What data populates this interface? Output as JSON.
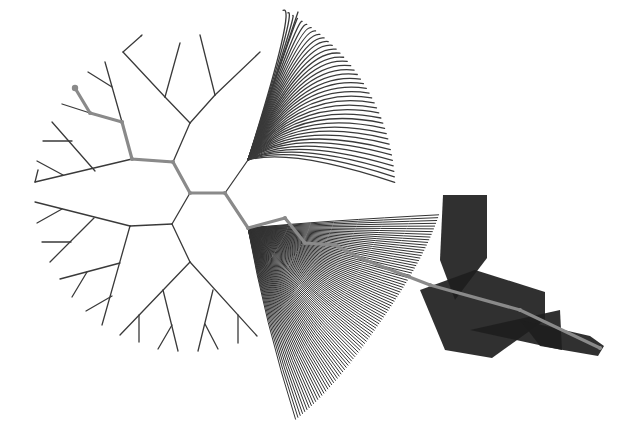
{
  "diagram": {
    "type": "radial-tree",
    "colors": {
      "background": "#ffffff",
      "edge": "#3a3a3a",
      "highlight_path": "#8a8a8a",
      "dense_fill": "#1e1e1e"
    },
    "highlight_path": [
      [
        75,
        88
      ],
      [
        90,
        113
      ],
      [
        122,
        122
      ],
      [
        132,
        159
      ],
      [
        173,
        162
      ],
      [
        190,
        193
      ],
      [
        225,
        193
      ],
      [
        248,
        228
      ],
      [
        285,
        218
      ],
      [
        305,
        243
      ],
      [
        335,
        245
      ],
      [
        360,
        258
      ],
      [
        430,
        285
      ],
      [
        520,
        310
      ],
      [
        600,
        348
      ]
    ],
    "edges": [
      [
        [
          190,
          193
        ],
        [
          225,
          193
        ]
      ],
      [
        [
          190,
          193
        ],
        [
          173,
          162
        ]
      ],
      [
        [
          190,
          193
        ],
        [
          172,
          224
        ]
      ],
      [
        [
          173,
          162
        ],
        [
          190,
          123
        ]
      ],
      [
        [
          173,
          162
        ],
        [
          132,
          159
        ]
      ],
      [
        [
          190,
          123
        ],
        [
          165,
          97
        ]
      ],
      [
        [
          165,
          97
        ],
        [
          123,
          52
        ]
      ],
      [
        [
          165,
          97
        ],
        [
          180,
          43
        ]
      ],
      [
        [
          123,
          52
        ],
        [
          141,
          36
        ]
      ],
      [
        [
          141,
          36
        ],
        [
          142,
          35
        ]
      ],
      [
        [
          190,
          123
        ],
        [
          215,
          95
        ]
      ],
      [
        [
          215,
          95
        ],
        [
          260,
          52
        ]
      ],
      [
        [
          215,
          95
        ],
        [
          200,
          35
        ]
      ],
      [
        [
          132,
          159
        ],
        [
          35,
          182
        ]
      ],
      [
        [
          132,
          159
        ],
        [
          122,
          122
        ]
      ],
      [
        [
          122,
          122
        ],
        [
          105,
          62
        ]
      ],
      [
        [
          112,
          87
        ],
        [
          88,
          72
        ]
      ],
      [
        [
          122,
          122
        ],
        [
          90,
          113
        ]
      ],
      [
        [
          90,
          113
        ],
        [
          62,
          104
        ]
      ],
      [
        [
          90,
          113
        ],
        [
          75,
          88
        ]
      ],
      [
        [
          35,
          182
        ],
        [
          38,
          170
        ]
      ],
      [
        [
          95,
          171
        ],
        [
          52,
          122
        ]
      ],
      [
        [
          72,
          141
        ],
        [
          43,
          141
        ]
      ],
      [
        [
          63,
          175
        ],
        [
          37,
          161
        ]
      ],
      [
        [
          172,
          224
        ],
        [
          130,
          226
        ]
      ],
      [
        [
          172,
          224
        ],
        [
          190,
          262
        ]
      ],
      [
        [
          130,
          226
        ],
        [
          35,
          202
        ]
      ],
      [
        [
          130,
          226
        ],
        [
          102,
          325
        ]
      ],
      [
        [
          62,
          209
        ],
        [
          37,
          223
        ]
      ],
      [
        [
          94,
          218
        ],
        [
          50,
          262
        ]
      ],
      [
        [
          71,
          242
        ],
        [
          42,
          242
        ]
      ],
      [
        [
          120,
          263
        ],
        [
          60,
          279
        ]
      ],
      [
        [
          87,
          272
        ],
        [
          72,
          297
        ]
      ],
      [
        [
          112,
          296
        ],
        [
          86,
          311
        ]
      ],
      [
        [
          190,
          262
        ],
        [
          120,
          335
        ]
      ],
      [
        [
          190,
          262
        ],
        [
          257,
          336
        ]
      ],
      [
        [
          139,
          315
        ],
        [
          139,
          342
        ]
      ],
      [
        [
          163,
          290
        ],
        [
          178,
          351
        ]
      ],
      [
        [
          172,
          325
        ],
        [
          158,
          349
        ]
      ],
      [
        [
          213,
          290
        ],
        [
          198,
          351
        ]
      ],
      [
        [
          205,
          324
        ],
        [
          218,
          349
        ]
      ],
      [
        [
          238,
          315
        ],
        [
          238,
          343
        ]
      ]
    ],
    "upper_right_fan": {
      "root": [
        225,
        193
      ],
      "trunk_to": [
        248,
        160
      ],
      "tip": [
        298,
        12
      ],
      "leaf_arc_center": [
        190,
        193
      ],
      "leaf_arc_radius": 205,
      "leaf_count": 40,
      "arc_start_deg": -63,
      "arc_end_deg": -3
    },
    "lower_right_fan": {
      "root": [
        248,
        228
      ],
      "leaf_arc_center": [
        190,
        193
      ],
      "leaf_arc_radius": 250,
      "leaf_count": 90,
      "arc_start_deg": 5,
      "arc_end_deg": 65
    },
    "dense_blocks": [
      {
        "points": [
          [
            443,
            195
          ],
          [
            487,
            195
          ],
          [
            487,
            258
          ],
          [
            455,
            300
          ],
          [
            440,
            260
          ]
        ]
      },
      {
        "points": [
          [
            420,
            290
          ],
          [
            475,
            270
          ],
          [
            545,
            292
          ],
          [
            545,
            320
          ],
          [
            492,
            358
          ],
          [
            445,
            350
          ]
        ]
      },
      {
        "points": [
          [
            470,
            330
          ],
          [
            560,
            310
          ],
          [
            562,
            350
          ]
        ]
      },
      {
        "points": [
          [
            520,
            320
          ],
          [
            590,
            336
          ],
          [
            604,
            346
          ],
          [
            598,
            356
          ],
          [
            540,
            346
          ]
        ]
      }
    ]
  }
}
